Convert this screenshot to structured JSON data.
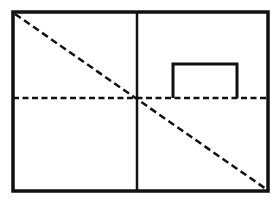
{
  "canvas": {
    "width": 276,
    "height": 204,
    "background": "#ffffff"
  },
  "colors": {
    "stroke": "#111111"
  },
  "frame": {
    "x1": 13,
    "y1": 12,
    "x2": 268,
    "y2": 191,
    "stroke_width": 3.5
  },
  "vertical_divider": {
    "x": 137,
    "y1": 12,
    "y2": 191,
    "stroke_width": 2.5
  },
  "horizontal_dashed": {
    "y": 98,
    "x1": 13,
    "x2": 268,
    "stroke_width": 2.5,
    "dash": "6 3.5"
  },
  "diagonal_dashed": {
    "x1": 15,
    "y1": 14,
    "x2": 266,
    "y2": 189,
    "stroke_width": 2.5,
    "dash": "7 4"
  },
  "inner_rect": {
    "x1": 173,
    "y1": 64,
    "x2": 237,
    "y2": 98,
    "stroke_width": 3
  }
}
